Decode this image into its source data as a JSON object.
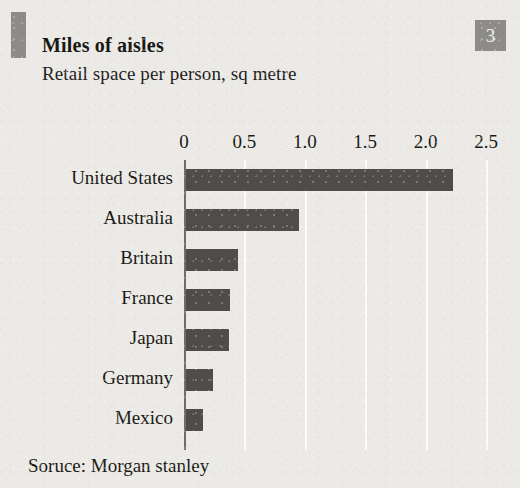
{
  "figure": {
    "number_badge": "3",
    "title": "Miles of aisles",
    "subtitle": "Retail space per person, sq metre",
    "source": "Soruce: Morgan stanley",
    "colors": {
      "background": "#eceae6",
      "bar": "#4e4d4b",
      "marker": "#8d8c88",
      "gridline": "#fbfbf9",
      "axis": "#6e6d69",
      "text": "#1b1a17"
    }
  },
  "chart_data": {
    "type": "bar",
    "orientation": "horizontal",
    "title": "Miles of aisles",
    "subtitle": "Retail space per person, sq metre",
    "xlabel": "",
    "ylabel": "",
    "xlim": [
      0,
      2.5
    ],
    "grid": true,
    "legend": null,
    "source": "Soruce: Morgan stanley",
    "xticks": [
      "0",
      "0.5",
      "1.0",
      "1.5",
      "2.0",
      "2.5"
    ],
    "xtick_values": [
      0,
      0.5,
      1.0,
      1.5,
      2.0,
      2.5
    ],
    "categories": [
      "United States",
      "Australia",
      "Britain",
      "France",
      "Japan",
      "Germany",
      "Mexico"
    ],
    "values": [
      2.23,
      0.95,
      0.45,
      0.38,
      0.37,
      0.24,
      0.16
    ]
  }
}
